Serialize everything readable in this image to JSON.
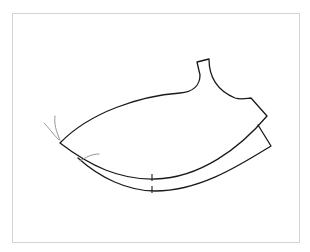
{
  "figure": {
    "type": "sewing-pattern-piece",
    "colors": {
      "outline": "#1a1a1a",
      "thread": "#8a8a8a",
      "frame": "#d4d4d4",
      "background": "#ffffff"
    },
    "marks": {
      "notch_count": 2
    }
  }
}
